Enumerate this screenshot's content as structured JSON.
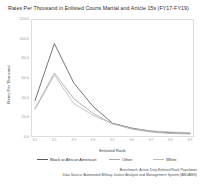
{
  "chart_data": {
    "type": "line",
    "title": "Rates Per Thousand in Enlisted Courts Martial and Article 15s (FY17-FY19)",
    "xlabel": "Enlisted Rank",
    "ylabel": "Rates Per Thousand",
    "categories": [
      "E1",
      "E2",
      "E3",
      "E4",
      "E5",
      "E6",
      "E7",
      "E8",
      "E9"
    ],
    "ylim": [
      0,
      120
    ],
    "yticks": [
      0.0,
      20.0,
      40.0,
      60.0,
      80.0,
      100.0,
      120.0
    ],
    "ytick_labels": [
      "0.0",
      "20.0",
      "40.0",
      "60.0",
      "80.0",
      "100.0",
      "120.0"
    ],
    "grid": false,
    "legend_position": "below",
    "series": [
      {
        "name": "Black or African American",
        "color": "#5b5b5b",
        "values": [
          37.0,
          95.0,
          55.0,
          31.0,
          14.0,
          9.0,
          6.0,
          4.5,
          4.0
        ]
      },
      {
        "name": "Other",
        "color": "#a8a8a8",
        "values": [
          29.0,
          65.0,
          39.0,
          24.0,
          13.5,
          8.0,
          5.0,
          3.5,
          3.0
        ]
      },
      {
        "name": "White",
        "color": "#bdbdbd",
        "values": [
          28.0,
          63.0,
          34.0,
          22.0,
          13.5,
          8.5,
          6.0,
          5.0,
          4.5
        ]
      }
    ],
    "annotations": [
      "Benchmark: Active Duty Enlisted Rank Population",
      "Data Source: Automated Military Justice Analysis and Management System (AMJAMS)"
    ]
  },
  "legend": {
    "items": [
      {
        "label": "Black or African American"
      },
      {
        "label": "Other"
      },
      {
        "label": "White"
      }
    ]
  },
  "footnotes": {
    "benchmark": "Benchmark: Active Duty Enlisted Rank Population",
    "source": "Data Source: Automated Military Justice Analysis and Management System (AMJAMS)"
  }
}
